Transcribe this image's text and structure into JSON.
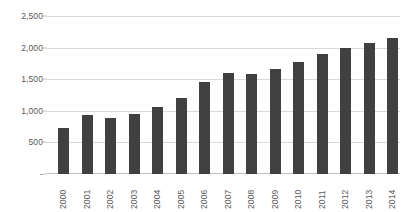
{
  "chart_data": {
    "type": "bar",
    "title": "",
    "subtitle": "",
    "xlabel": "",
    "ylabel": "",
    "categories": [
      "2000",
      "2001",
      "2002",
      "2003",
      "2004",
      "2005",
      "2006",
      "2007",
      "2008",
      "2009",
      "2010",
      "2011",
      "2012",
      "2013",
      "2014"
    ],
    "values": [
      728,
      928,
      880,
      945,
      1060,
      1200,
      1460,
      1590,
      1575,
      1655,
      1775,
      1895,
      1990,
      2075,
      2150
    ],
    "series": [
      {
        "name": "",
        "values": [
          728,
          928,
          880,
          945,
          1060,
          1200,
          1460,
          1590,
          1575,
          1655,
          1775,
          1895,
          1990,
          2075,
          2150
        ]
      }
    ],
    "ylim": [
      0,
      2500
    ],
    "ytick_values": [
      0,
      500,
      1000,
      1500,
      2000,
      2500
    ],
    "ytick_labels": [
      "-",
      "500",
      "1,000",
      "1,500",
      "2,000",
      "2,500"
    ],
    "grid": true,
    "grid_axis": "y",
    "legend": false,
    "legend_position": "none",
    "annotations": [],
    "bar_color": "#404040",
    "gridline_color": "#d9d9d9",
    "axis_color": "#bfbfbf",
    "tick_label_color": "#595959",
    "background_color": "#ffffff",
    "xtick_rotation": 90
  }
}
